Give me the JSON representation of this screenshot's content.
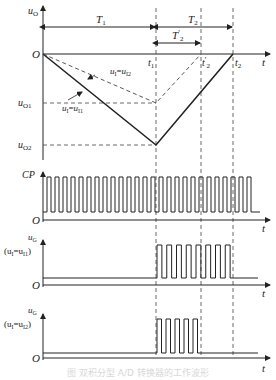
{
  "figure": {
    "panels": {
      "integrator": {
        "y_axis_label": "u",
        "y_axis_sub": "O",
        "origin": "O",
        "t_label": "t",
        "levels": [
          {
            "label": "u",
            "sub": "O1"
          },
          {
            "label": "u",
            "sub": "O2"
          }
        ],
        "time_marks": [
          {
            "label": "t",
            "sub": "1",
            "prime": ""
          },
          {
            "label": "t",
            "sub": "2",
            "prime": "′"
          },
          {
            "label": "t",
            "sub": "2",
            "prime": ""
          }
        ],
        "intervals": [
          {
            "label": "T",
            "sub": "1",
            "prime": ""
          },
          {
            "label": "T",
            "sub": "2",
            "prime": ""
          },
          {
            "label": "T",
            "sub": "2",
            "prime": "′"
          }
        ],
        "curves": [
          {
            "name": "ui=ui1",
            "label_main": "u",
            "label_sub": "I",
            "eq": "=",
            "label_main2": "u",
            "label_sub2": "I1",
            "style": "solid"
          },
          {
            "name": "ui=ui2",
            "label_main": "u",
            "label_sub": "I",
            "eq": "=",
            "label_main2": "u",
            "label_sub2": "I2",
            "style": "dashed"
          }
        ]
      },
      "clock": {
        "y_axis_label": "CP",
        "origin": "O",
        "t_label": "t",
        "pulse_count": 26
      },
      "gate1": {
        "y_axis_label": "u",
        "y_axis_sub": "G",
        "condition": "(u",
        "condition_sub": "I",
        "condition_eq": "=u",
        "condition_sub2": "I1",
        "condition_close": ")",
        "origin": "O",
        "t_label": "t",
        "pulse_count": 8
      },
      "gate2": {
        "y_axis_label": "u",
        "y_axis_sub": "G",
        "condition": "(u",
        "condition_sub": "I",
        "condition_eq": "=u",
        "condition_sub2": "I2",
        "condition_close": ")",
        "origin": "O",
        "t_label": "t",
        "pulse_count": 5
      }
    },
    "caption": "图 双积分型 A/D 转换器的工作波形"
  }
}
